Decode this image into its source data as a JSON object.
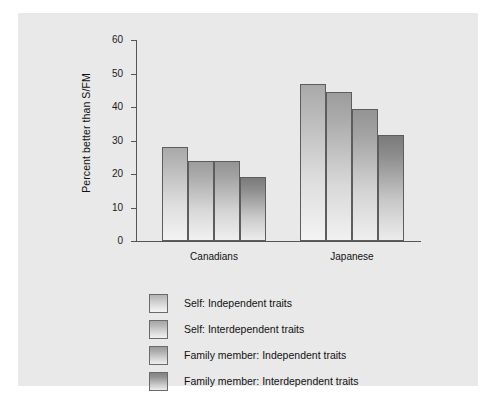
{
  "figure": {
    "background_color": "#ffffff",
    "panel_color": "#e9e9e9"
  },
  "chart_data": {
    "type": "bar",
    "title": "",
    "xlabel": "",
    "ylabel": "Percent better than S/FM",
    "ylim": [
      0,
      60
    ],
    "yticks": [
      0,
      10,
      20,
      30,
      40,
      50,
      60
    ],
    "ytick_labels": [
      "0",
      "10",
      "20",
      "30",
      "40",
      "50",
      "60"
    ],
    "grid": false,
    "legend_position": "below",
    "categories": [
      "Canadians",
      "Japanese"
    ],
    "series": [
      {
        "name": "Self: Independent traits",
        "values": [
          28,
          47
        ],
        "color": "#b4b4b4"
      },
      {
        "name": "Self: Interdependent traits",
        "values": [
          24,
          44.5
        ],
        "color": "#a6a6a6"
      },
      {
        "name": "Family member: Independent traits",
        "values": [
          24,
          39.5
        ],
        "color": "#9b9b9b"
      },
      {
        "name": "Family member: Interdependent traits",
        "values": [
          19,
          31.5
        ],
        "color": "#828282"
      }
    ]
  }
}
